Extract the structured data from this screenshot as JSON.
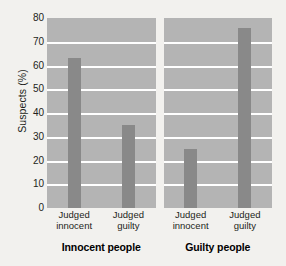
{
  "chart_data": {
    "type": "bar",
    "title": "",
    "xlabel": "",
    "ylabel": "Suspects (%)",
    "ylim": [
      0,
      80
    ],
    "yticks": [
      0,
      10,
      20,
      30,
      40,
      50,
      60,
      70,
      80
    ],
    "grid": true,
    "legend": "none",
    "panels": [
      {
        "group_title": "Innocent people",
        "categories": [
          "Judged innocent",
          "Judged guilty"
        ],
        "values": [
          63,
          35
        ]
      },
      {
        "group_title": "Guilty people",
        "categories": [
          "Judged innocent",
          "Judged guilty"
        ],
        "values": [
          25,
          76
        ]
      }
    ],
    "colors": {
      "bar": "#898989",
      "panel_background": "#b4b4b4",
      "gridline": "#ffffff",
      "page_background": "#f2f1ee",
      "text": "#231f20"
    }
  }
}
